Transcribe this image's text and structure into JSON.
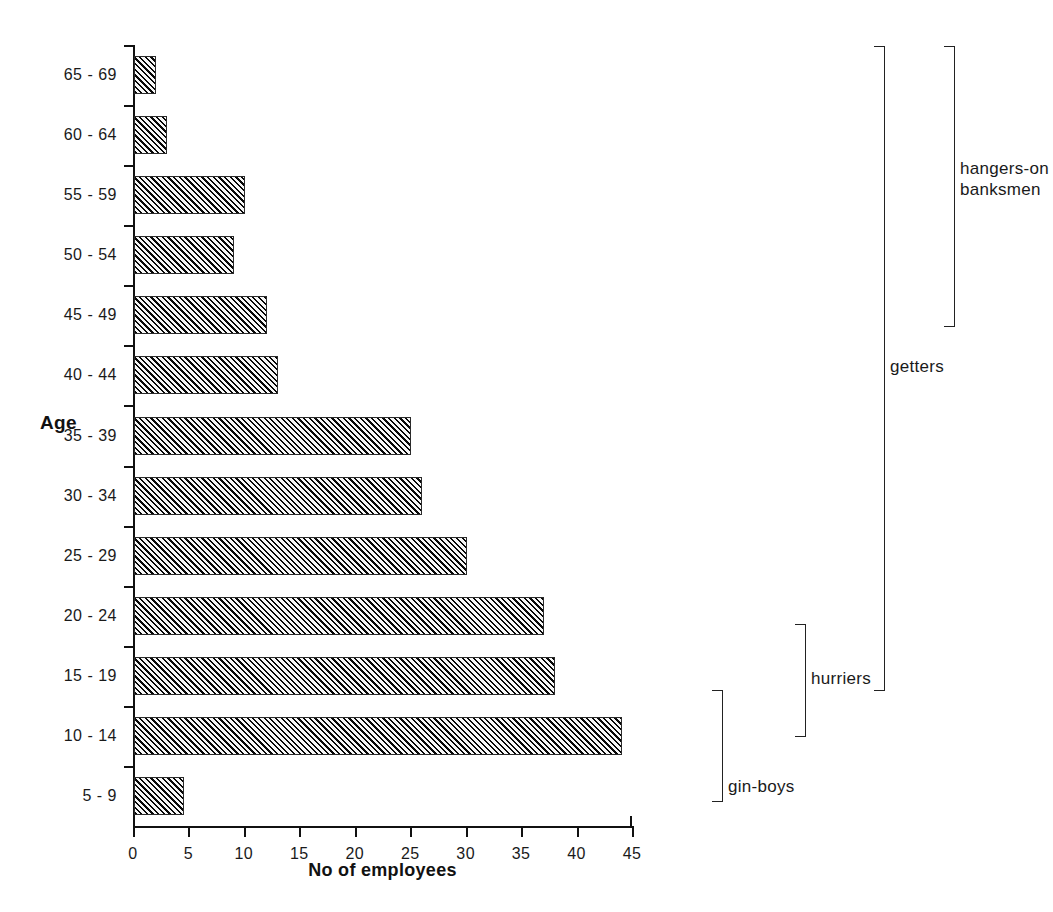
{
  "chart_data": {
    "type": "bar",
    "orientation": "horizontal",
    "title": "",
    "xlabel": "No of employees",
    "ylabel": "Age",
    "categories": [
      "65 - 69",
      "60 - 64",
      "55 - 59",
      "50 - 54",
      "45 - 49",
      "40 - 44",
      "35 - 39",
      "30 - 34",
      "25 - 29",
      "20 - 24",
      "15 - 19",
      "10 - 14",
      "5 - 9"
    ],
    "values": [
      2,
      3,
      10,
      9,
      12,
      13,
      25,
      26,
      30,
      37,
      38,
      44,
      4.5
    ],
    "xlim": [
      0,
      45
    ],
    "xticks": [
      0,
      5,
      10,
      15,
      20,
      25,
      30,
      35,
      40,
      45
    ],
    "xtick_labels": [
      "0",
      "5",
      "10",
      "15",
      "20",
      "25",
      "30",
      "35",
      "40",
      "45"
    ],
    "grid": false,
    "legend": "none",
    "bar_fill": "#5c5c5c",
    "bar_hatch": "diagonal-45",
    "axis_color": "#111111",
    "annotations": [
      {
        "label": "gin-boys",
        "covers": [
          "5 - 9"
        ],
        "bracket_side": "left-open"
      },
      {
        "label": "hurriers",
        "covers": [
          "15 - 19",
          "10 - 14"
        ],
        "bracket_side": "left-open"
      },
      {
        "label": "getters",
        "covers": [
          "65 - 69",
          "60 - 64",
          "55 - 59",
          "50 - 54",
          "45 - 49",
          "40 - 44",
          "35 - 39",
          "30 - 34",
          "25 - 29",
          "20 - 24"
        ],
        "bracket_side": "left-open"
      },
      {
        "label": "hangers-on\nbanksmen",
        "label_line1": "hangers-on",
        "label_line2": "banksmen",
        "covers": [
          "65 - 69",
          "60 - 64",
          "55 - 59",
          "50 - 54",
          "45 - 49"
        ],
        "bracket_side": "left-open"
      }
    ]
  },
  "axes": {
    "y_title": "Age",
    "x_title": "No of employees"
  },
  "groups": {
    "gin_boys": "gin-boys",
    "hurriers": "hurriers",
    "getters": "getters",
    "hangers_line1": "hangers-on",
    "hangers_line2": "banksmen"
  }
}
